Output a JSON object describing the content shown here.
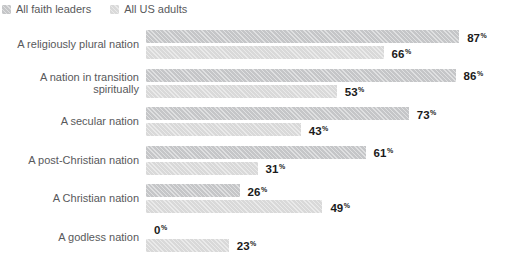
{
  "legend": {
    "items": [
      {
        "label": "All faith leaders",
        "color": "#c5c6c8"
      },
      {
        "label": "All US adults",
        "color": "#d9d9d9"
      }
    ]
  },
  "chart_data": {
    "type": "bar",
    "orientation": "horizontal",
    "title": "",
    "xlabel": "",
    "ylabel": "",
    "xlim": [
      0,
      100
    ],
    "grid": false,
    "legend_position": "top-left",
    "value_labels": true,
    "value_suffix": "%",
    "categories": [
      "A religiously plural nation",
      "A nation in transition spiritually",
      "A secular nation",
      "A post-Christian nation",
      "A Christian nation",
      "A godless nation"
    ],
    "series": [
      {
        "name": "All faith leaders",
        "color": "#c5c6c8",
        "values": [
          87,
          86,
          73,
          61,
          26,
          0
        ]
      },
      {
        "name": "All US adults",
        "color": "#d9d9d9",
        "values": [
          66,
          53,
          43,
          31,
          49,
          23
        ]
      }
    ],
    "colors": {
      "value_label_text": "#1b1b1b",
      "category_label_text": "#58595b",
      "legend_text": "#58595b",
      "background": "#ffffff"
    }
  }
}
